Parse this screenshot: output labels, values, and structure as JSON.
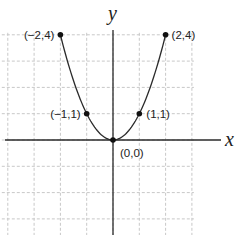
{
  "chart_data": {
    "type": "line",
    "title": "",
    "function": "y = x^2",
    "xlabel": "x",
    "ylabel": "y",
    "xlim": [
      -4,
      3
    ],
    "ylim": [
      -3,
      4
    ],
    "grid": true,
    "grid_style": "dashed",
    "x": [
      -2,
      -1,
      0,
      1,
      2
    ],
    "series": [
      {
        "name": "y = x^2",
        "values": [
          4,
          1,
          0,
          1,
          4
        ]
      }
    ],
    "points": [
      {
        "x": -2,
        "y": 4,
        "label": "(−2,4)"
      },
      {
        "x": -1,
        "y": 1,
        "label": "(−1,1)"
      },
      {
        "x": 0,
        "y": 0,
        "label": "(0,0)"
      },
      {
        "x": 1,
        "y": 1,
        "label": "(1,1)"
      },
      {
        "x": 2,
        "y": 4,
        "label": "(2,4)"
      }
    ]
  },
  "layout": {
    "origin_px": [
      113,
      140
    ],
    "unit_px": 26.3,
    "grid_x_units": [
      -4,
      -3,
      -2,
      -1,
      0,
      1,
      2,
      3
    ],
    "grid_y_units": [
      4,
      3,
      2,
      1,
      0,
      -1,
      -2,
      -3
    ],
    "colors": {
      "grid": "#c8c8c8",
      "axis": "#2a2a2a",
      "point": "#111111",
      "text": "#222222"
    }
  }
}
